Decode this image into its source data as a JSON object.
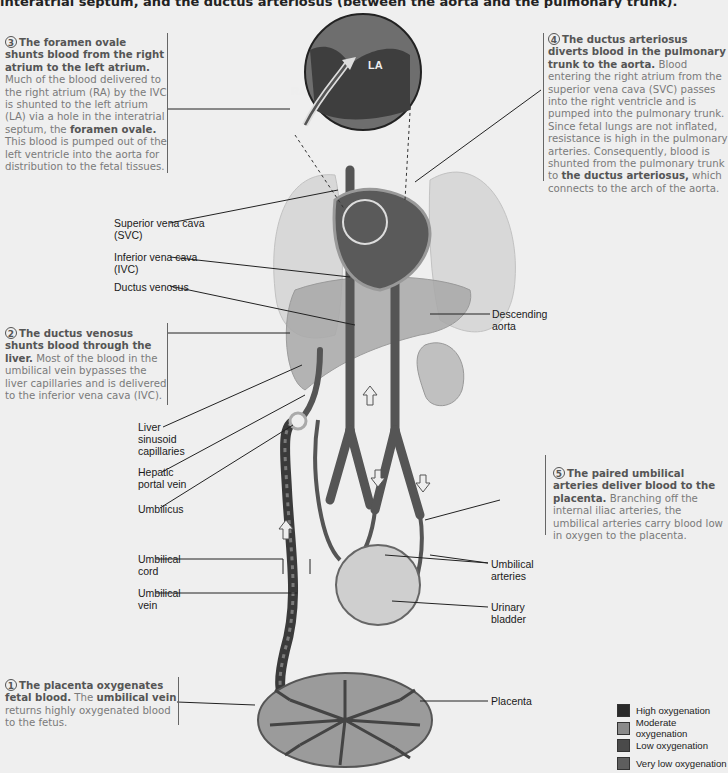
{
  "header": {
    "cut_off_text": "interatrial septum, and the ductus arteriosus (between the aorta and the pulmonary trunk)."
  },
  "steps": [
    {
      "number": "1",
      "title": "The placenta oxygenates fetal blood.",
      "body_before": "The",
      "bold_mid": "umbilical vein",
      "body_after": "returns highly oxygenated blood to the fetus."
    },
    {
      "number": "2",
      "title": "The ductus venosus shunts blood through the liver.",
      "body": "Most of the blood in the umbilical vein bypasses the liver capillaries and is delivered to the inferior vena cava (IVC)."
    },
    {
      "number": "3",
      "title": "The foramen ovale shunts blood from the right atrium to the left atrium.",
      "body": "Much of the blood delivered to the right atrium (RA) by the IVC is shunted to the left atrium (LA) via a hole in the interatrial septum, the",
      "bold_end": "foramen ovale.",
      "body_after": "This blood is pumped out of the left ventricle into the aorta for distribution to the fetal tissues."
    },
    {
      "number": "4",
      "title": "The ductus arteriosus diverts blood in the pulmonary trunk to the aorta.",
      "body": "Blood entering the right atrium from the superior vena cava (SVC) passes into the right ventricle and is pumped into the pulmonary trunk. Since fetal lungs are not inflated, resistance is high in the pulmonary arteries. Consequently, blood is shunted from the pulmonary trunk to",
      "bold_end": "the ductus arteriosus,",
      "body_after": "which connects to the arch of the aorta."
    },
    {
      "number": "5",
      "title": "The paired umbilical arteries deliver blood to the placenta.",
      "body": "Branching off the internal iliac arteries, the umbilical arteries carry blood low in oxygen to the placenta."
    }
  ],
  "inset": {
    "ra": "RA",
    "la": "LA"
  },
  "labels": {
    "svc": [
      "Superior vena cava",
      "(SVC)"
    ],
    "ivc": [
      "Inferior vena cava",
      "(IVC)"
    ],
    "ductus_venosus": "Ductus venosus",
    "descending_aorta": [
      "Descending",
      "aorta"
    ],
    "liver_sinusoid": [
      "Liver",
      "sinusoid",
      "capillaries"
    ],
    "hepatic_portal": [
      "Hepatic",
      "portal vein"
    ],
    "umbilicus": "Umbilicus",
    "umbilical_cord": [
      "Umbilical",
      "cord"
    ],
    "umbilical_vein": [
      "Umbilical",
      "vein"
    ],
    "umbilical_arteries": [
      "Umbilical",
      "arteries"
    ],
    "urinary_bladder": [
      "Urinary",
      "bladder"
    ],
    "placenta": "Placenta"
  },
  "legend": [
    {
      "label": "High oxygenation",
      "color": "#2a2a2a"
    },
    {
      "label": "Moderate oxygenation",
      "color": "#8a8a8a"
    },
    {
      "label": "Low oxygenation",
      "color": "#4a4a4a"
    },
    {
      "label": "Very low oxygenation",
      "color": "#5e5e5e"
    }
  ]
}
